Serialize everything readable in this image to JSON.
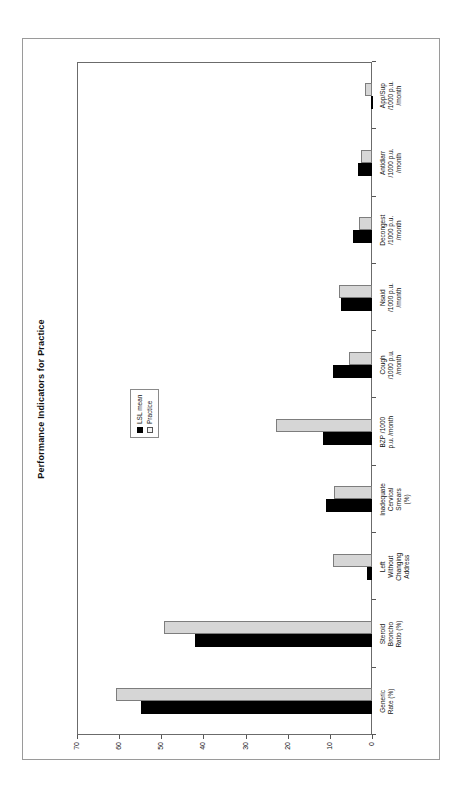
{
  "chart_data": {
    "type": "bar",
    "orientation": "vertical-rotated",
    "title": "Performance Indicators for Practice",
    "xlabel": "",
    "ylabel": "",
    "ylim": [
      0,
      70
    ],
    "grid": false,
    "legend_position": "upper-center",
    "axis_ticks": [
      70,
      60,
      50,
      40,
      30,
      20,
      10,
      0
    ],
    "tick_labels": [
      "70",
      "60",
      "50",
      "40",
      "30",
      "20",
      "10",
      "0"
    ],
    "categories": [
      "Generic\nRate (%)",
      "Steroid\nBroncho\nRatio (%)",
      "Left\nWithout\nChanging\nAddress",
      "Inadequate\nCervical\nSmears\n(%)",
      "BZP /1000\np.u. /month",
      "Cough\n/1000 p.u.\n/month",
      "Nsaid\n/1000 p.u.\n/month",
      "Decongest\n/1000 p.u.\n/month",
      "Antidiarr\n/1000 p.u.\n/month",
      "App/Sup\n/1000 p.u.\n/month"
    ],
    "series": [
      {
        "name": "LSL mean",
        "color": "#000000",
        "values": [
          54.7,
          42.1,
          1.2,
          10.8,
          11.7,
          9.3,
          7.4,
          4.5,
          3.3,
          0.3
        ]
      },
      {
        "name": "Practice",
        "color": "#d6d6d6",
        "values": [
          60.7,
          49.3,
          9.3,
          8.9,
          22.7,
          5.5,
          7.9,
          3.1,
          2.6,
          1.7
        ]
      }
    ]
  },
  "legend": {
    "items": [
      {
        "label": "LSL mean"
      },
      {
        "label": "Practice"
      }
    ]
  },
  "colors": {
    "series_lsl": "#000000",
    "series_practice": "#d6d6d6",
    "frame": "#9a9a9a",
    "plot_border": "#6b6b6b",
    "text": "#111111"
  }
}
